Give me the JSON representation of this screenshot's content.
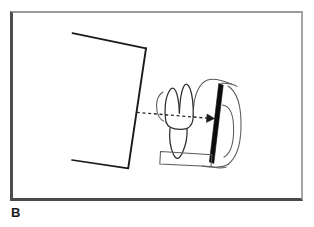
{
  "figure": {
    "label": "B",
    "caption_letter": "B",
    "panel": {
      "background_color": "#ffffff",
      "border_dark_color": "#4a4a4a",
      "border_light_color": "#a0a0a0",
      "x": 10,
      "y": 11,
      "width": 293,
      "height": 190
    },
    "diagram_type": "line-drawing",
    "elements": [
      {
        "name": "xray-tube-head-cone",
        "description": "open quadrilateral outline representing the x-ray position indicating device (PID) aimed at the tooth",
        "stroke_color": "#1a1a1a",
        "stroke_width": 1.6,
        "points": "72,33 146,48 128,168 72,160"
      },
      {
        "name": "tooth",
        "description": "cross-section of a posterior tooth showing two crown cusps, cervical line and tapering root",
        "stroke_color": "#333333",
        "stroke_width": 1.2
      },
      {
        "name": "xray-film-sensor",
        "description": "solid black angled bar representing the radiographic film or digital sensor held parallel to the long axis of the tooth",
        "fill_color": "#0d0d0d",
        "points": "219.5,84 223,85.5 213.5,163 209.5,162"
      },
      {
        "name": "film-holder-bite-block",
        "description": "horizontal platform of the film holder that the patient bites on",
        "stroke_color": "#555555"
      },
      {
        "name": "oral-anatomy-outline",
        "description": "curved outlines behind the sensor representing palate and surrounding soft tissue",
        "stroke_color": "#555555"
      },
      {
        "name": "central-xray-beam-arrow",
        "description": "horizontal dashed arrow showing the central ray travelling from the cone through the tooth perpendicular to the film",
        "stroke_color": "#2a2a2a",
        "dash_pattern": "3,2.6",
        "start": "137,112.5",
        "end": "212,118.5"
      }
    ]
  }
}
